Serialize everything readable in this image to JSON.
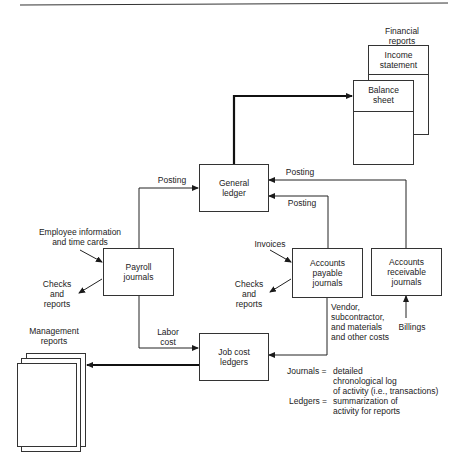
{
  "diagram": {
    "financial_reports": {
      "title": "Financial\nreports",
      "income_statement": "Income\nstatement",
      "balance_sheet": "Balance\nsheet"
    },
    "boxes": {
      "general_ledger": "General\nledger",
      "payroll_journals": "Payroll\njournals",
      "accounts_payable_journals": "Accounts\npayable\njournals",
      "accounts_receivable_journals": "Accounts\nreceivable\njournals",
      "job_cost_ledgers": "Job cost\nledgers"
    },
    "labels": {
      "posting_payroll": "Posting",
      "posting_ar": "Posting",
      "posting_ap": "Posting",
      "employee_info": "Employee information\nand time cards",
      "checks_reports_payroll": "Checks\nand\nreports",
      "invoices": "Invoices",
      "checks_reports_ap": "Checks\nand\nreports",
      "vendor_costs": "Vendor,\nsubcontractor,\nand materials\nand other costs",
      "billings": "Billings",
      "labor_cost": "Labor\ncost",
      "management_reports": "Management\nreports"
    },
    "legend": {
      "journals_term": "Journals =",
      "journals_def": "detailed\nchronological log\nof activity (i.e., transactions)",
      "ledgers_term": "Ledgers =",
      "ledgers_def": "summarization of\nactivity for reports"
    },
    "colors": {
      "line": "#1a1a1a",
      "background": "#ffffff"
    }
  }
}
